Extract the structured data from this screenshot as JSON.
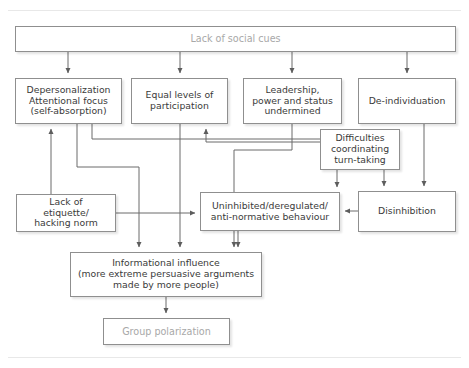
{
  "diagram": {
    "type": "flowchart",
    "colors": {
      "box_border": "#8f8f8f",
      "box_fill": "#ffffff",
      "text": "#3a3a3a",
      "muted_text": "#a8a8a8",
      "connector": "#6b6b6b",
      "rule": "#e8e8e8"
    },
    "nodes": [
      {
        "id": "cues",
        "label": "Lack of social cues",
        "style": "muted"
      },
      {
        "id": "deperson",
        "label": "Depersonalization\nAttentional focus\n(self-absorption)",
        "style": "normal"
      },
      {
        "id": "equal",
        "label": "Equal levels of\nparticipation",
        "style": "normal"
      },
      {
        "id": "leader",
        "label": "Leadership,\npower and status\nundermined",
        "style": "normal"
      },
      {
        "id": "deindiv",
        "label": "De-individuation",
        "style": "normal"
      },
      {
        "id": "difficult",
        "label": "Difficulties\ncoordinating\nturn-taking",
        "style": "normal"
      },
      {
        "id": "etiquette",
        "label": "Lack of\netiquette/\nhacking norm",
        "style": "normal"
      },
      {
        "id": "uninhib",
        "label": "Uninhibited/deregulated/\nanti-normative behaviour",
        "style": "normal"
      },
      {
        "id": "disinhib",
        "label": "Disinhibition",
        "style": "normal"
      },
      {
        "id": "infoinf",
        "label": "Informational influence\n(more extreme persuasive arguments\nmade by more people)",
        "style": "normal"
      },
      {
        "id": "grouppol",
        "label": "Group polarization",
        "style": "muted"
      }
    ],
    "edges": [
      {
        "from": "cues",
        "to": "deperson"
      },
      {
        "from": "cues",
        "to": "equal"
      },
      {
        "from": "cues",
        "to": "leader"
      },
      {
        "from": "cues",
        "to": "deindiv"
      },
      {
        "from": "etiquette",
        "to": "deperson"
      },
      {
        "from": "etiquette",
        "to": "uninhib"
      },
      {
        "from": "deperson",
        "to": "uninhib"
      },
      {
        "from": "deperson",
        "to": "infoinf"
      },
      {
        "from": "equal",
        "to": "infoinf"
      },
      {
        "from": "leader",
        "to": "infoinf"
      },
      {
        "from": "difficult",
        "to": "equal"
      },
      {
        "from": "difficult",
        "to": "disinhib"
      },
      {
        "from": "deindiv",
        "to": "disinhib"
      },
      {
        "from": "disinhib",
        "to": "uninhib"
      },
      {
        "from": "uninhib",
        "to": "infoinf"
      },
      {
        "from": "infoinf",
        "to": "grouppol"
      }
    ]
  }
}
